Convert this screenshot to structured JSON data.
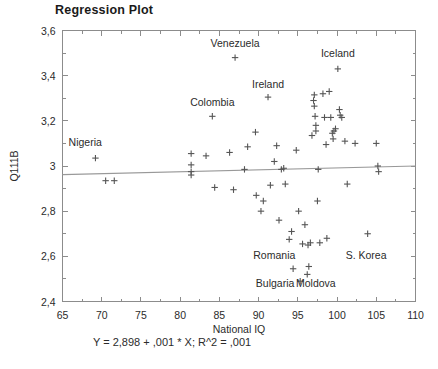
{
  "chart_data": {
    "type": "scatter",
    "title": "Regression Plot",
    "xlabel": "National IQ",
    "ylabel": "Q111B",
    "xlim": [
      65,
      110
    ],
    "ylim": [
      2.4,
      3.6
    ],
    "xticks": [
      "65",
      "70",
      "75",
      "80",
      "85",
      "90",
      "95",
      "100",
      "105",
      "110"
    ],
    "yticks": [
      "3,6",
      "3,4",
      "3,2",
      "3",
      "2,8",
      "2,6",
      "2,4"
    ],
    "xtick_values": [
      65,
      70,
      75,
      80,
      85,
      90,
      95,
      100,
      105,
      110
    ],
    "ytick_values": [
      3.6,
      3.4,
      3.2,
      3.0,
      2.8,
      2.6,
      2.4
    ],
    "grid": false,
    "minor_ticks": true,
    "legend": "none",
    "marker": "plus",
    "marker_color": "#555555",
    "fit_line": {
      "equation_text": "Y = 2,898 + ,001 * X; R^2 = ,001",
      "intercept": 2.898,
      "slope": 0.001,
      "r_squared": 0.001,
      "color": "#999999"
    },
    "points": [
      {
        "x": 69.2,
        "y": 3.035
      },
      {
        "x": 70.5,
        "y": 2.935
      },
      {
        "x": 71.6,
        "y": 2.935
      },
      {
        "x": 81.4,
        "y": 3.055
      },
      {
        "x": 81.4,
        "y": 3.005
      },
      {
        "x": 81.4,
        "y": 2.975
      },
      {
        "x": 81.4,
        "y": 2.96
      },
      {
        "x": 83.3,
        "y": 3.045
      },
      {
        "x": 84.1,
        "y": 3.22
      },
      {
        "x": 84.4,
        "y": 2.905
      },
      {
        "x": 86.3,
        "y": 3.06
      },
      {
        "x": 86.8,
        "y": 2.895
      },
      {
        "x": 87.0,
        "y": 3.48
      },
      {
        "x": 88.2,
        "y": 2.985
      },
      {
        "x": 88.6,
        "y": 3.085
      },
      {
        "x": 89.6,
        "y": 3.15
      },
      {
        "x": 89.7,
        "y": 2.87
      },
      {
        "x": 90.3,
        "y": 2.8
      },
      {
        "x": 90.6,
        "y": 2.845
      },
      {
        "x": 91.2,
        "y": 3.305
      },
      {
        "x": 91.5,
        "y": 2.915
      },
      {
        "x": 92.0,
        "y": 3.02
      },
      {
        "x": 92.3,
        "y": 3.09
      },
      {
        "x": 92.6,
        "y": 2.76
      },
      {
        "x": 92.9,
        "y": 2.985
      },
      {
        "x": 93.2,
        "y": 2.99
      },
      {
        "x": 93.4,
        "y": 2.92
      },
      {
        "x": 93.9,
        "y": 2.675
      },
      {
        "x": 94.2,
        "y": 2.71
      },
      {
        "x": 94.4,
        "y": 2.545
      },
      {
        "x": 94.8,
        "y": 3.07
      },
      {
        "x": 95.1,
        "y": 2.8
      },
      {
        "x": 95.3,
        "y": 2.49
      },
      {
        "x": 95.6,
        "y": 2.655
      },
      {
        "x": 95.9,
        "y": 2.74
      },
      {
        "x": 96.2,
        "y": 2.52
      },
      {
        "x": 96.3,
        "y": 2.65
      },
      {
        "x": 96.4,
        "y": 2.555
      },
      {
        "x": 96.6,
        "y": 2.66
      },
      {
        "x": 96.8,
        "y": 3.135
      },
      {
        "x": 97.0,
        "y": 3.29
      },
      {
        "x": 97.1,
        "y": 3.315
      },
      {
        "x": 97.1,
        "y": 3.265
      },
      {
        "x": 97.2,
        "y": 3.22
      },
      {
        "x": 97.3,
        "y": 3.155
      },
      {
        "x": 97.3,
        "y": 3.18
      },
      {
        "x": 97.5,
        "y": 2.845
      },
      {
        "x": 97.6,
        "y": 2.985
      },
      {
        "x": 97.8,
        "y": 2.66
      },
      {
        "x": 98.2,
        "y": 3.32
      },
      {
        "x": 98.4,
        "y": 3.215
      },
      {
        "x": 98.6,
        "y": 3.095
      },
      {
        "x": 98.7,
        "y": 2.68
      },
      {
        "x": 99.0,
        "y": 3.33
      },
      {
        "x": 99.2,
        "y": 3.215
      },
      {
        "x": 99.4,
        "y": 3.145
      },
      {
        "x": 99.5,
        "y": 3.12
      },
      {
        "x": 99.6,
        "y": 3.155
      },
      {
        "x": 99.8,
        "y": 3.165
      },
      {
        "x": 100.1,
        "y": 3.43
      },
      {
        "x": 100.3,
        "y": 3.25
      },
      {
        "x": 100.4,
        "y": 3.225
      },
      {
        "x": 100.6,
        "y": 3.215
      },
      {
        "x": 101.0,
        "y": 3.11
      },
      {
        "x": 101.3,
        "y": 2.92
      },
      {
        "x": 102.3,
        "y": 3.1
      },
      {
        "x": 103.9,
        "y": 2.7
      },
      {
        "x": 105.0,
        "y": 3.1
      },
      {
        "x": 105.2,
        "y": 3.0
      },
      {
        "x": 105.3,
        "y": 2.975
      }
    ],
    "annotations": [
      {
        "text": "Venezuela",
        "x": 87.0,
        "y": 3.545
      },
      {
        "text": "Iceland",
        "x": 100.1,
        "y": 3.5
      },
      {
        "text": "Colombia",
        "x": 84.1,
        "y": 3.285
      },
      {
        "text": "Ireland",
        "x": 91.2,
        "y": 3.365
      },
      {
        "text": "Nigeria",
        "x": 67.9,
        "y": 3.105
      },
      {
        "text": "Romania",
        "x": 92.0,
        "y": 2.605
      },
      {
        "text": "Bulgaria",
        "x": 92.1,
        "y": 2.48
      },
      {
        "text": "Moldova",
        "x": 97.3,
        "y": 2.48
      },
      {
        "text": "S. Korea",
        "x": 103.7,
        "y": 2.605
      }
    ]
  }
}
